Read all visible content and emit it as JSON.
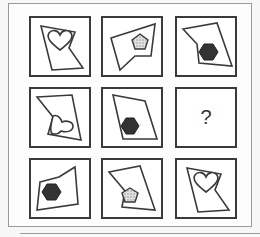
{
  "puzzle": {
    "type": "3x3 visual reasoning matrix",
    "cells": [
      {
        "row": 1,
        "col": 1,
        "outer_shape": "irregular-polygon",
        "inner_shape": "heart",
        "fill": "white"
      },
      {
        "row": 1,
        "col": 2,
        "outer_shape": "irregular-polygon",
        "inner_shape": "pentagon",
        "fill": "dotted-gray"
      },
      {
        "row": 1,
        "col": 3,
        "outer_shape": "irregular-polygon",
        "inner_shape": "hexagon",
        "fill": "black"
      },
      {
        "row": 2,
        "col": 1,
        "outer_shape": "irregular-polygon",
        "inner_shape": "heart",
        "fill": "white"
      },
      {
        "row": 2,
        "col": 2,
        "outer_shape": "irregular-polygon",
        "inner_shape": "hexagon",
        "fill": "black"
      },
      {
        "row": 2,
        "col": 3,
        "missing": true,
        "label": "?"
      },
      {
        "row": 3,
        "col": 1,
        "outer_shape": "irregular-polygon",
        "inner_shape": "hexagon",
        "fill": "black"
      },
      {
        "row": 3,
        "col": 2,
        "outer_shape": "irregular-polygon",
        "inner_shape": "pentagon",
        "fill": "dotted-gray"
      },
      {
        "row": 3,
        "col": 3,
        "outer_shape": "irregular-polygon",
        "inner_shape": "heart",
        "fill": "white"
      }
    ],
    "missing_label": "?"
  },
  "colors": {
    "stroke": "#3a3a3a",
    "hexagon": "#333333",
    "pentagon": "#cfcfcf",
    "frame": "#9a9a9a"
  }
}
